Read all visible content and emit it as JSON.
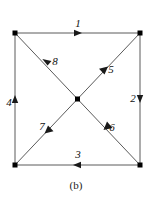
{
  "figure": {
    "caption": "(b)",
    "background_color": "#ffffff",
    "edge_color": "#5a5a5a",
    "vertex_color": "#000000",
    "arrow_color": "#1a1a1a",
    "label_color": "#111111"
  },
  "graph": {
    "type": "directed-graph",
    "vertices": [
      {
        "id": "tl",
        "name": "top-left-vertex",
        "x": 15,
        "y": 33,
        "shape": "square"
      },
      {
        "id": "tr",
        "name": "top-right-vertex",
        "x": 140,
        "y": 33,
        "shape": "square"
      },
      {
        "id": "bl",
        "name": "bottom-left-vertex",
        "x": 15,
        "y": 165,
        "shape": "square"
      },
      {
        "id": "br",
        "name": "bottom-right-vertex",
        "x": 140,
        "y": 165,
        "shape": "square"
      },
      {
        "id": "c",
        "name": "center-vertex",
        "x": 77.5,
        "y": 99,
        "shape": "square"
      }
    ],
    "edges": [
      {
        "label": "1",
        "from": "tl",
        "to": "tr",
        "direction": "right",
        "label_x": 78,
        "label_y": 24
      },
      {
        "label": "2",
        "from": "tr",
        "to": "br",
        "direction": "down",
        "label_x": 133,
        "label_y": 99
      },
      {
        "label": "3",
        "from": "br",
        "to": "bl",
        "direction": "left",
        "label_x": 78,
        "label_y": 155
      },
      {
        "label": "4",
        "from": "bl",
        "to": "tl",
        "direction": "up",
        "label_x": 9,
        "label_y": 103
      },
      {
        "label": "5",
        "from": "c",
        "to": "tr",
        "direction": "up-right",
        "label_x": 111,
        "label_y": 70
      },
      {
        "label": "6",
        "from": "br",
        "to": "c",
        "direction": "up-left",
        "label_x": 112,
        "label_y": 128
      },
      {
        "label": "7",
        "from": "c",
        "to": "bl",
        "direction": "down-left",
        "label_x": 42,
        "label_y": 127
      },
      {
        "label": "8",
        "from": "tl",
        "to": "c",
        "direction": "down-right",
        "label_x": 55,
        "label_y": 62
      }
    ]
  },
  "caption": {
    "text": "(b)",
    "x": 76,
    "y": 186
  }
}
